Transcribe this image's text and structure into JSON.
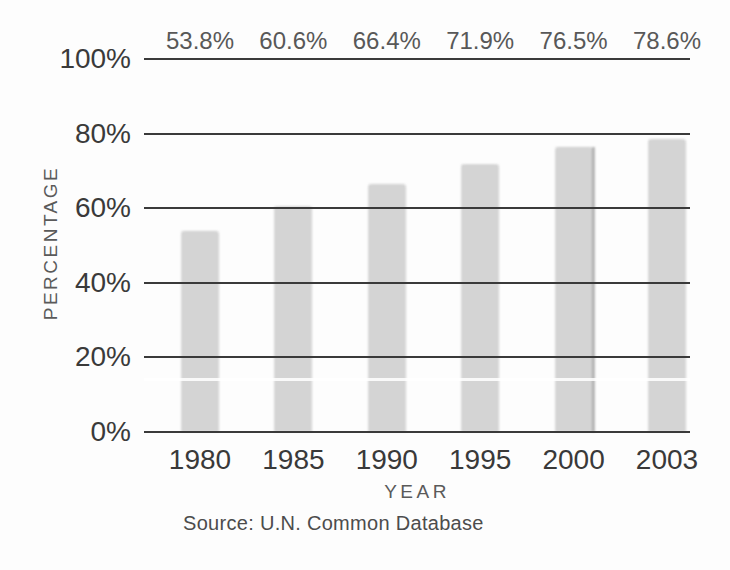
{
  "figure": {
    "background_color": "#fdfdfd",
    "bar_color": "#c8c8c8",
    "gridline_color": "#3a3a3a",
    "text_color": "#3a3a3a",
    "secondary_text_color": "#5a5a5a"
  },
  "chart_data": {
    "type": "bar",
    "title": "",
    "categories": [
      "1980",
      "1985",
      "1990",
      "1995",
      "2000",
      "2003"
    ],
    "values": [
      53.8,
      60.6,
      66.4,
      71.9,
      76.5,
      78.6
    ],
    "value_labels": [
      "53.8%",
      "60.6%",
      "66.4%",
      "71.9%",
      "76.5%",
      "78.6%"
    ],
    "xlabel": "YEAR",
    "ylabel": "PERCENTAGE",
    "ylim": [
      0,
      100
    ],
    "y_ticks": [
      0,
      20,
      40,
      60,
      80,
      100
    ],
    "y_tick_labels": [
      "0%",
      "20%",
      "40%",
      "60%",
      "80%",
      "100%"
    ],
    "grid": "horizontal gridlines at every 20%",
    "legend": "none",
    "source": "Source: U.N. Common Database"
  }
}
